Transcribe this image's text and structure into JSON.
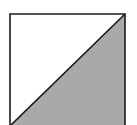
{
  "figure": {
    "shapes": [
      {
        "name": "square-outline",
        "kind": "square"
      },
      {
        "name": "upper-left-triangle",
        "kind": "triangle",
        "fill": "#ffffff"
      },
      {
        "name": "lower-right-triangle",
        "kind": "triangle",
        "fill": "#a9a9a9",
        "shaded": true
      },
      {
        "name": "diagonal-line",
        "kind": "line",
        "from": "bottom-left",
        "to": "top-right"
      }
    ],
    "colors": {
      "stroke": "#1a1a1a",
      "shade": "#a9a9a9",
      "background": "#ffffff"
    }
  }
}
